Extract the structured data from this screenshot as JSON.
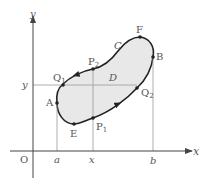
{
  "figure": {
    "type": "closed-curve-region-diagram",
    "colors": {
      "curve": "#222222",
      "fill": "#e8e8e8",
      "axis": "#444444",
      "guide": "#9a9a9a",
      "label": "#555555"
    }
  },
  "axes": {
    "x_label": "x",
    "y_label": "y",
    "origin_label": "O"
  },
  "ticks": {
    "x": [
      {
        "label": "a"
      },
      {
        "label": "x"
      },
      {
        "label": "b"
      }
    ],
    "y": [
      {
        "label": "y"
      }
    ]
  },
  "region": {
    "curve_label": "C",
    "region_label": "D"
  },
  "points": {
    "A": "A",
    "B": "B",
    "E": "E",
    "F": "F",
    "P1": "P",
    "P1_sub": "1",
    "P2": "P",
    "P2_sub": "2",
    "Q1": "Q",
    "Q1_sub": "1",
    "Q2": "Q",
    "Q2_sub": "2"
  }
}
